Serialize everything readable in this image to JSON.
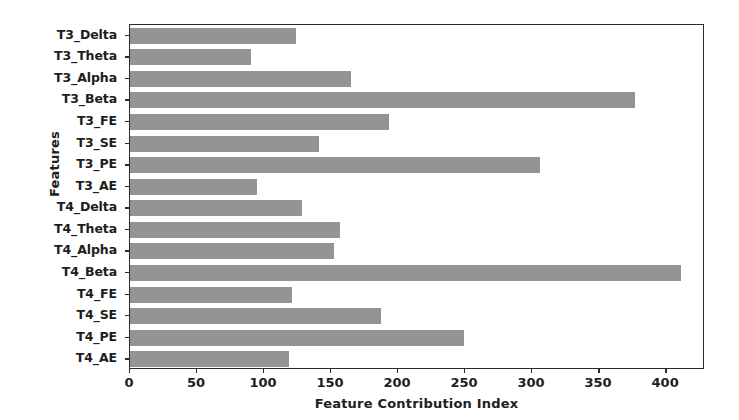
{
  "chart_data": {
    "type": "bar",
    "orientation": "horizontal",
    "title": "",
    "xlabel": "Feature Contribution Index",
    "ylabel": "Features",
    "categories": [
      "T3_Delta",
      "T3_Theta",
      "T3_Alpha",
      "T3_Beta",
      "T3_FE",
      "T3_SE",
      "T3_PE",
      "T3_AE",
      "T4_Delta",
      "T4_Theta",
      "T4_Alpha",
      "T4_Beta",
      "T4_FE",
      "T4_SE",
      "T4_PE",
      "T4_AE"
    ],
    "values": [
      124,
      90,
      165,
      377,
      193,
      141,
      306,
      95,
      128,
      157,
      152,
      411,
      121,
      187,
      249,
      119
    ],
    "xticks": [
      0,
      50,
      100,
      150,
      200,
      250,
      300,
      350,
      400
    ],
    "xticklabels": [
      "0",
      "50",
      "100",
      "150",
      "200",
      "250",
      "300",
      "350",
      "400"
    ],
    "xlim": [
      0,
      429
    ],
    "grid": false,
    "legend": null,
    "bar_color": "#949494",
    "axis_color": "#2b2b2b",
    "background_color": "#ffffff"
  }
}
